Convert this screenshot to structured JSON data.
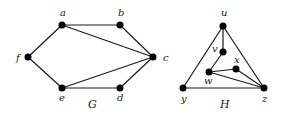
{
  "graphs": [
    {
      "name": "G",
      "name_pos": [
        88,
        108
      ],
      "nodes": [
        {
          "id": "a",
          "x": 62,
          "y": 25,
          "lx": 60,
          "ly": 16
        },
        {
          "id": "b",
          "x": 120,
          "y": 25,
          "lx": 118,
          "ly": 16
        },
        {
          "id": "c",
          "x": 153,
          "y": 57,
          "lx": 163,
          "ly": 61
        },
        {
          "id": "d",
          "x": 120,
          "y": 88,
          "lx": 117,
          "ly": 101
        },
        {
          "id": "e",
          "x": 62,
          "y": 88,
          "lx": 59,
          "ly": 101
        },
        {
          "id": "f",
          "x": 28,
          "y": 57,
          "lx": 16,
          "ly": 61
        }
      ],
      "edges": [
        [
          "a",
          "b"
        ],
        [
          "a",
          "f"
        ],
        [
          "a",
          "c"
        ],
        [
          "b",
          "c"
        ],
        [
          "c",
          "e"
        ],
        [
          "c",
          "d"
        ],
        [
          "e",
          "f"
        ],
        [
          "e",
          "d"
        ]
      ]
    },
    {
      "name": "H",
      "name_pos": [
        220,
        108
      ],
      "nodes": [
        {
          "id": "u",
          "x": 223,
          "y": 26,
          "lx": 221,
          "ly": 16
        },
        {
          "id": "v",
          "x": 223,
          "y": 52,
          "lx": 212,
          "ly": 52
        },
        {
          "id": "w",
          "x": 209,
          "y": 72,
          "lx": 204,
          "ly": 84
        },
        {
          "id": "x",
          "x": 236,
          "y": 69,
          "lx": 234,
          "ly": 63
        },
        {
          "id": "y",
          "x": 183,
          "y": 88,
          "lx": 181,
          "ly": 102
        },
        {
          "id": "z",
          "x": 264,
          "y": 88,
          "lx": 262,
          "ly": 102
        }
      ],
      "edges": [
        [
          "u",
          "v"
        ],
        [
          "u",
          "y"
        ],
        [
          "u",
          "z"
        ],
        [
          "v",
          "w"
        ],
        [
          "w",
          "x"
        ],
        [
          "w",
          "z"
        ],
        [
          "x",
          "z"
        ],
        [
          "y",
          "z"
        ]
      ]
    }
  ],
  "style": {
    "node_color": "#000000",
    "edge_color": "#1a1a1a",
    "node_radius": 3.5
  }
}
